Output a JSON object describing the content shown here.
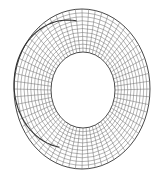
{
  "figure": {
    "background": "#ffffff",
    "line_color": "#5a5a5a",
    "rim_color": "#333333",
    "outer": {
      "cx": 82,
      "cy": 89,
      "rx": 68,
      "ry": 80
    },
    "inner": {
      "cx": 83,
      "cy": 90,
      "rx": 32,
      "ry": 38
    },
    "fold": {
      "cx": 68,
      "cy": 84,
      "rx": 54,
      "ry": 64
    },
    "radial_lines": 64,
    "rings": 11
  }
}
